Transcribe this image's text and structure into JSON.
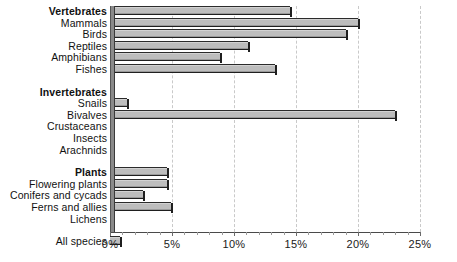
{
  "chart_data": {
    "type": "bar",
    "orientation": "horizontal",
    "title": "",
    "xlabel": "",
    "ylabel": "",
    "xlim": [
      0,
      25
    ],
    "xunit": "%",
    "grid": true,
    "legend": null,
    "axis": {
      "ticks": [
        0,
        5,
        10,
        15,
        20,
        25
      ],
      "tick_labels": [
        "0%",
        "5%",
        "10%",
        "15%",
        "20%",
        "25%"
      ],
      "minor_tick_step": 1
    },
    "categories": [
      "Vertebrates",
      "Mammals",
      "Birds",
      "Reptiles",
      "Amphibians",
      "Fishes",
      "Invertebrates",
      "Snails",
      "Bivalves",
      "Crustaceans",
      "Insects",
      "Arachnids",
      "Plants",
      "Flowering plants",
      "Conifers and cycads",
      "Ferns and allies",
      "Lichens",
      "All species"
    ],
    "values": [
      14.5,
      20.0,
      19.0,
      11.1,
      8.9,
      13.3,
      0.3,
      1.4,
      23.0,
      0.3,
      0.1,
      0.1,
      4.6,
      4.6,
      2.7,
      4.9,
      0.3,
      0.8
    ],
    "rows": [
      {
        "label": "Vertebrates",
        "value": 14.5,
        "group": true,
        "spacer_before": 0
      },
      {
        "label": "Mammals",
        "value": 20.0,
        "group": false,
        "spacer_before": 0
      },
      {
        "label": "Birds",
        "value": 19.0,
        "group": false,
        "spacer_before": 0
      },
      {
        "label": "Reptiles",
        "value": 11.1,
        "group": false,
        "spacer_before": 0
      },
      {
        "label": "Amphibians",
        "value": 8.9,
        "group": false,
        "spacer_before": 0
      },
      {
        "label": "Fishes",
        "value": 13.3,
        "group": false,
        "spacer_before": 0
      },
      {
        "label": "Invertebrates",
        "value": 0.3,
        "group": true,
        "spacer_before": 1
      },
      {
        "label": "Snails",
        "value": 1.4,
        "group": false,
        "spacer_before": 0
      },
      {
        "label": "Bivalves",
        "value": 23.0,
        "group": false,
        "spacer_before": 0
      },
      {
        "label": "Crustaceans",
        "value": 0.3,
        "group": false,
        "spacer_before": 0
      },
      {
        "label": "Insects",
        "value": 0.1,
        "group": false,
        "spacer_before": 0
      },
      {
        "label": "Arachnids",
        "value": 0.1,
        "group": false,
        "spacer_before": 0
      },
      {
        "label": "Plants",
        "value": 4.6,
        "group": true,
        "spacer_before": 1
      },
      {
        "label": "Flowering plants",
        "value": 4.6,
        "group": false,
        "spacer_before": 0
      },
      {
        "label": "Conifers and cycads",
        "value": 2.7,
        "group": false,
        "spacer_before": 0
      },
      {
        "label": "Ferns and allies",
        "value": 4.9,
        "group": false,
        "spacer_before": 0
      },
      {
        "label": "Lichens",
        "value": 0.3,
        "group": false,
        "spacer_before": 0
      },
      {
        "label": "All species",
        "value": 0.8,
        "group": false,
        "spacer_before": 1
      }
    ],
    "colors": {
      "bar_face": "#bdbdbd",
      "bar_edge": "#1f1f1f",
      "gridline": "#c9c9c9",
      "axis": "#4a4a4a",
      "text": "#111111",
      "background": "#ffffff"
    }
  }
}
